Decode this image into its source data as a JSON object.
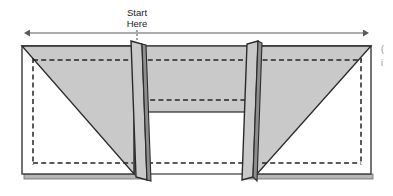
{
  "figure": {
    "type": "folding-instruction-diagram",
    "background_color": "#ffffff"
  },
  "colors": {
    "panel_fill": "#c9c9c9",
    "panel_fill_light": "#d2d2d2",
    "white_fill": "#ffffff",
    "outline": "#3a3a3a",
    "outline_dark": "#2b2b2b",
    "dashed_line": "#242424",
    "shadow_band": "#b6b6b6",
    "arrow": "#5a5a5a",
    "label_text": "#1b1b1b",
    "edge_fragment": "#8a8a8a"
  },
  "annotations": {
    "start_label": {
      "line1": "Start",
      "line2": "Here",
      "leader": "dotted-vertical-leader"
    },
    "width_arrow": {
      "name": "full-width-double-arrow",
      "direction": "double-headed-horizontal",
      "x_start": 30,
      "x_end": 363,
      "y": 33
    }
  },
  "edge_fragments": {
    "frag_top": "(",
    "frag_bottom": "i"
  },
  "geometry": {
    "body": {
      "left": 22,
      "right": 371,
      "top": 46,
      "bottom": 174
    },
    "folds": [
      {
        "name": "left-fold-flap",
        "top_x": 132,
        "bottom_x": 145
      },
      {
        "name": "right-fold-flap",
        "top_x": 257,
        "bottom_x": 248
      }
    ],
    "dashed_lines": [
      {
        "name": "upper-hem-dashed-line",
        "y": 60
      },
      {
        "name": "center-band-dashed-line",
        "y": 100
      },
      {
        "name": "lower-hem-dashed-line",
        "y": 163
      }
    ],
    "center_band_bottom_y": 112
  }
}
